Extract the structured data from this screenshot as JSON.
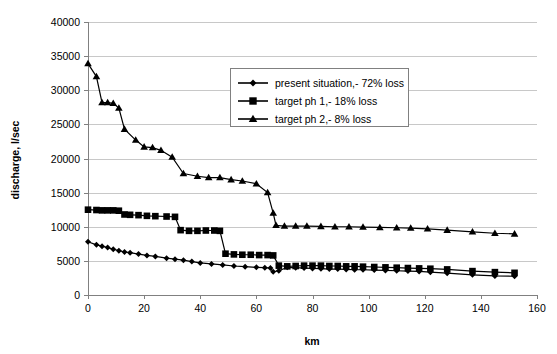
{
  "chart_data": {
    "type": "line",
    "title": "",
    "xlabel": "km",
    "ylabel": "discharge, l/sec",
    "xlim": [
      0,
      160
    ],
    "ylim": [
      0,
      40000
    ],
    "xticks": [
      0,
      20,
      40,
      60,
      80,
      100,
      120,
      140,
      160
    ],
    "yticks": [
      0,
      5000,
      10000,
      15000,
      20000,
      25000,
      30000,
      35000,
      40000
    ],
    "xtick_labels": [
      "0",
      "20",
      "40",
      "60",
      "80",
      "100",
      "120",
      "140",
      "160"
    ],
    "ytick_labels": [
      "0",
      "5000",
      "10000",
      "15000",
      "20000",
      "25000",
      "30000",
      "35000",
      "40000"
    ],
    "grid": "horizontal",
    "legend_position": "upper-center-right",
    "series": [
      {
        "name": "present situation,- 72% loss",
        "marker": "diamond",
        "color": "#000000",
        "points": [
          [
            0,
            7800
          ],
          [
            3,
            7350
          ],
          [
            5,
            7150
          ],
          [
            7,
            6950
          ],
          [
            9,
            6700
          ],
          [
            11,
            6500
          ],
          [
            13,
            6300
          ],
          [
            15,
            6200
          ],
          [
            18,
            6000
          ],
          [
            21,
            5800
          ],
          [
            24,
            5650
          ],
          [
            28,
            5400
          ],
          [
            31,
            5250
          ],
          [
            34,
            5100
          ],
          [
            37,
            4900
          ],
          [
            40,
            4700
          ],
          [
            44,
            4550
          ],
          [
            48,
            4400
          ],
          [
            52,
            4250
          ],
          [
            56,
            4150
          ],
          [
            60,
            4050
          ],
          [
            63,
            4000
          ],
          [
            65,
            3950
          ],
          [
            66,
            3400
          ],
          [
            68,
            3550
          ],
          [
            71,
            4050
          ],
          [
            74,
            4000
          ],
          [
            77,
            3950
          ],
          [
            80,
            3900
          ],
          [
            83,
            3850
          ],
          [
            86,
            3800
          ],
          [
            89,
            3800
          ],
          [
            92,
            3750
          ],
          [
            95,
            3700
          ],
          [
            98,
            3700
          ],
          [
            102,
            3650
          ],
          [
            106,
            3600
          ],
          [
            110,
            3550
          ],
          [
            114,
            3500
          ],
          [
            118,
            3450
          ],
          [
            122,
            3350
          ],
          [
            128,
            3200
          ],
          [
            137,
            2950
          ],
          [
            145,
            2800
          ],
          [
            152,
            2750
          ]
        ]
      },
      {
        "name": "target ph 1,- 18% loss",
        "marker": "square",
        "color": "#000000",
        "points": [
          [
            0,
            12500
          ],
          [
            3,
            12450
          ],
          [
            5,
            12400
          ],
          [
            7,
            12400
          ],
          [
            9,
            12400
          ],
          [
            11,
            12350
          ],
          [
            13,
            11800
          ],
          [
            15,
            11750
          ],
          [
            18,
            11700
          ],
          [
            21,
            11600
          ],
          [
            24,
            11550
          ],
          [
            28,
            11500
          ],
          [
            31,
            11450
          ],
          [
            33,
            9500
          ],
          [
            36,
            9400
          ],
          [
            39,
            9400
          ],
          [
            42,
            9450
          ],
          [
            45,
            9450
          ],
          [
            47,
            9400
          ],
          [
            49,
            6050
          ],
          [
            52,
            5950
          ],
          [
            55,
            5900
          ],
          [
            58,
            5900
          ],
          [
            61,
            5850
          ],
          [
            64,
            5850
          ],
          [
            66,
            5800
          ],
          [
            68,
            4300
          ],
          [
            71,
            4200
          ],
          [
            74,
            4250
          ],
          [
            77,
            4300
          ],
          [
            80,
            4300
          ],
          [
            83,
            4300
          ],
          [
            86,
            4250
          ],
          [
            89,
            4250
          ],
          [
            92,
            4200
          ],
          [
            95,
            4200
          ],
          [
            98,
            4150
          ],
          [
            102,
            4100
          ],
          [
            106,
            4050
          ],
          [
            110,
            4000
          ],
          [
            114,
            3950
          ],
          [
            118,
            3900
          ],
          [
            122,
            3850
          ],
          [
            128,
            3750
          ],
          [
            137,
            3500
          ],
          [
            145,
            3350
          ],
          [
            152,
            3250
          ]
        ]
      },
      {
        "name": "target ph 2,- 8% loss",
        "marker": "triangle",
        "color": "#000000",
        "points": [
          [
            0,
            33900
          ],
          [
            3,
            32000
          ],
          [
            5,
            28200
          ],
          [
            7,
            28200
          ],
          [
            9,
            28100
          ],
          [
            11,
            27400
          ],
          [
            13,
            24300
          ],
          [
            17,
            22700
          ],
          [
            20,
            21700
          ],
          [
            23,
            21600
          ],
          [
            26,
            21200
          ],
          [
            30,
            20200
          ],
          [
            34,
            17800
          ],
          [
            39,
            17400
          ],
          [
            43,
            17200
          ],
          [
            47,
            17200
          ],
          [
            51,
            16900
          ],
          [
            55,
            16700
          ],
          [
            60,
            16300
          ],
          [
            64,
            15000
          ],
          [
            66,
            12000
          ],
          [
            67,
            10200
          ],
          [
            70,
            10100
          ],
          [
            74,
            10100
          ],
          [
            78,
            10100
          ],
          [
            83,
            10050
          ],
          [
            88,
            10000
          ],
          [
            93,
            10000
          ],
          [
            98,
            9950
          ],
          [
            104,
            9900
          ],
          [
            110,
            9850
          ],
          [
            115,
            9800
          ],
          [
            121,
            9700
          ],
          [
            128,
            9500
          ],
          [
            137,
            9250
          ],
          [
            145,
            9050
          ],
          [
            152,
            8950
          ]
        ]
      }
    ]
  }
}
